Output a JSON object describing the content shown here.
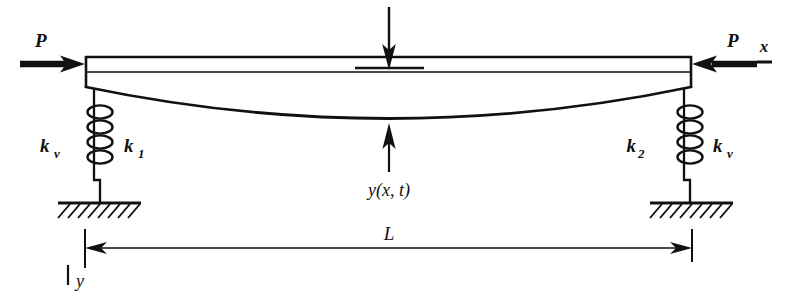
{
  "figure": {
    "ink_color": "#111111",
    "background_color": "#ffffff"
  },
  "labels": {
    "load_left": "P",
    "load_right": "P",
    "axis_x": "x",
    "axis_y": "y",
    "spring_left_outer": "k",
    "spring_left_outer_sub": "v",
    "spring_left_inner": "k",
    "spring_left_inner_sub": "1",
    "spring_right_inner": "k",
    "spring_right_inner_sub": "2",
    "spring_right_outer": "k",
    "spring_right_outer_sub": "v",
    "deflection": "y(x, t)",
    "span": "L"
  },
  "geometry": {
    "beam_left_x": 85,
    "beam_right_x": 692,
    "beam_top_y": 57,
    "beam_mid_y": 72,
    "beam_bottom_y": 87,
    "curve_min_y": 122,
    "curve_center_x": 389,
    "ground_y": 203,
    "dim_line_y": 248,
    "spring_left_x": 94,
    "spring_right_x": 684,
    "spring_coils": 4
  }
}
